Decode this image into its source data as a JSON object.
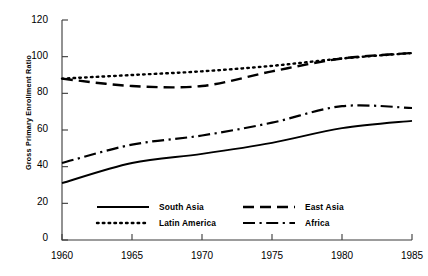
{
  "chart_data": {
    "type": "line",
    "title": "",
    "xlabel": "",
    "ylabel": "Gross Primary Enrollment Ratio",
    "xlim": [
      1960,
      1985
    ],
    "ylim": [
      0,
      120
    ],
    "xticks": [
      "1960",
      "1965",
      "1970",
      "1975",
      "1980",
      "1985"
    ],
    "yticks": [
      "0",
      "20",
      "40",
      "60",
      "80",
      "100",
      "120"
    ],
    "grid": false,
    "legend_position": "inside-bottom",
    "x": [
      1960,
      1965,
      1970,
      1975,
      1980,
      1985
    ],
    "series": [
      {
        "name": "South Asia",
        "style": "solid",
        "values": [
          31,
          42,
          47,
          53,
          61,
          65
        ]
      },
      {
        "name": "Latin America",
        "style": "dotted",
        "values": [
          88,
          90,
          92,
          95,
          99,
          102
        ]
      },
      {
        "name": "East Asia",
        "style": "dashed",
        "values": [
          88,
          84,
          84,
          92,
          99,
          102
        ]
      },
      {
        "name": "Africa",
        "style": "dashdot",
        "values": [
          42,
          52,
          57,
          64,
          73,
          72
        ]
      }
    ],
    "colors": {
      "ink": "#000000",
      "axis": "#3a3a3a",
      "background": "#ffffff"
    }
  },
  "legend": {
    "entries": [
      {
        "label": "South Asia",
        "style": "solid"
      },
      {
        "label": "East Asia",
        "style": "dashed"
      },
      {
        "label": "Latin America",
        "style": "dotted"
      },
      {
        "label": "Africa",
        "style": "dashdot"
      }
    ]
  }
}
